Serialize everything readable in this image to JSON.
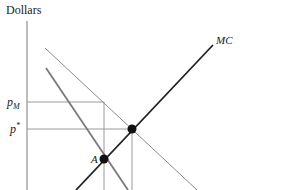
{
  "axes": {
    "y_label": "Dollars"
  },
  "price_labels": {
    "p_monopoly_base": "p",
    "p_monopoly_sub": "M",
    "p_star_base": "p",
    "p_star_sup": "*"
  },
  "curves": {
    "mc_label": "MC"
  },
  "points": {
    "A_label": "A"
  },
  "colors": {
    "axis": "#9a9a9a",
    "mc": "#222222",
    "demand": "#8a8a8a",
    "mr": "#7a7a7a",
    "guides": "#9a9a9a",
    "dot": "#111111"
  }
}
